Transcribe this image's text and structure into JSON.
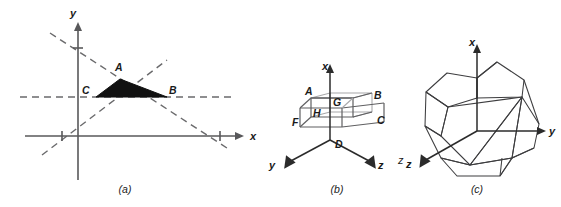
{
  "figure": {
    "background_color": "#ffffff",
    "ink_color": "#1a1a1a",
    "shade_color": "#111111",
    "axis_color": "#58585a",
    "panels": [
      {
        "id": "a",
        "caption": "(a)",
        "type": "2d-cartesian-shaded-triangle",
        "axes": [
          {
            "name": "x",
            "label": "x"
          },
          {
            "name": "y",
            "label": "y"
          }
        ],
        "tick_count": 3,
        "dashed_line_count": 3,
        "vertices": [
          {
            "label": "A",
            "role": "apex"
          },
          {
            "label": "B",
            "role": "right"
          },
          {
            "label": "C",
            "role": "left"
          }
        ]
      },
      {
        "id": "b",
        "caption": "(b)",
        "type": "3d-box-wireframe",
        "axes": [
          {
            "name": "x",
            "label": "x"
          },
          {
            "name": "y",
            "label": "y"
          },
          {
            "name": "z",
            "label": "z"
          }
        ],
        "vertices": [
          {
            "label": "A"
          },
          {
            "label": "B"
          },
          {
            "label": "C"
          },
          {
            "label": "D"
          },
          {
            "label": "F"
          },
          {
            "label": "G"
          },
          {
            "label": "H"
          }
        ],
        "stray_label": "z"
      },
      {
        "id": "c",
        "caption": "(c)",
        "type": "3d-polyhedron-wireframe",
        "axes": [
          {
            "name": "x",
            "label": "x"
          },
          {
            "name": "y",
            "label": "y"
          },
          {
            "name": "z",
            "label": "z"
          }
        ]
      }
    ]
  }
}
